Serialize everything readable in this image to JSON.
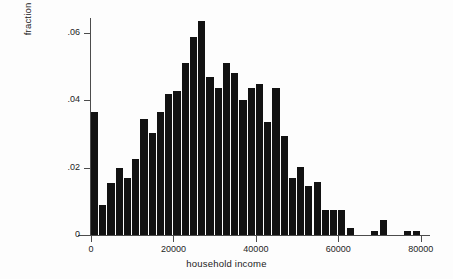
{
  "chart_data": {
    "type": "bar",
    "title": "",
    "subtitle": "",
    "xlabel": "household income",
    "ylabel": "fraction of cases",
    "grid": false,
    "legend": false,
    "legend_position": "none",
    "xlim": [
      0,
      82000
    ],
    "ylim": [
      0,
      0.066
    ],
    "xticks": [
      0,
      20000,
      40000,
      60000,
      80000
    ],
    "xtick_labels": [
      "0",
      "20000",
      "40000",
      "60000",
      "80000"
    ],
    "yticks": [
      0,
      0.02,
      0.04,
      0.06
    ],
    "ytick_labels": [
      "0",
      ".02",
      ".04",
      ".06"
    ],
    "bin_width": 2000,
    "bar_color": "#121212",
    "axis_color": "#4c4c4c",
    "background_color": "#ffffff",
    "categories": [
      "0-2000",
      "2000-4000",
      "4000-6000",
      "6000-8000",
      "8000-10000",
      "10000-12000",
      "12000-14000",
      "14000-16000",
      "16000-18000",
      "18000-20000",
      "20000-22000",
      "22000-24000",
      "24000-26000",
      "26000-28000",
      "28000-30000",
      "30000-32000",
      "32000-34000",
      "34000-36000",
      "36000-38000",
      "38000-40000",
      "40000-42000",
      "42000-44000",
      "44000-46000",
      "46000-48000",
      "48000-50000",
      "50000-52000",
      "52000-54000",
      "54000-56000",
      "56000-58000",
      "58000-60000",
      "60000-62000",
      "62000-64000",
      "64000-66000",
      "66000-68000",
      "68000-70000",
      "70000-72000",
      "72000-74000",
      "74000-76000",
      "76000-78000",
      "78000-80000"
    ],
    "x": [
      1000,
      3000,
      5000,
      7000,
      9000,
      11000,
      13000,
      15000,
      17000,
      19000,
      21000,
      23000,
      25000,
      27000,
      29000,
      31000,
      33000,
      35000,
      37000,
      39000,
      41000,
      43000,
      45000,
      47000,
      49000,
      51000,
      53000,
      55000,
      57000,
      59000,
      61000,
      63000,
      65000,
      67000,
      69000,
      71000,
      73000,
      75000,
      77000,
      79000
    ],
    "values": [
      0.0364,
      0.009,
      0.0155,
      0.02,
      0.017,
      0.0225,
      0.0345,
      0.0302,
      0.0364,
      0.042,
      0.0428,
      0.051,
      0.0588,
      0.0636,
      0.0468,
      0.0438,
      0.051,
      0.048,
      0.04,
      0.0438,
      0.0448,
      0.0336,
      0.0438,
      0.0295,
      0.017,
      0.0203,
      0.0145,
      0.0157,
      0.0075,
      0.0075,
      0.0075,
      0.0022,
      0.0,
      0.0,
      0.0012,
      0.0045,
      0.0,
      0.0,
      0.0012,
      0.0012
    ]
  },
  "axis": {
    "ylabel_text": "fraction of cases",
    "xlabel_text": "household income"
  }
}
